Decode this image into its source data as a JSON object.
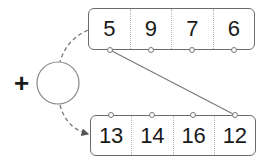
{
  "diagram": {
    "top_row": {
      "values": [
        "5",
        "9",
        "7",
        "6"
      ]
    },
    "bottom_row": {
      "values": [
        "13",
        "14",
        "16",
        "12"
      ]
    },
    "operator": "+",
    "operand_circle": "",
    "connector": {
      "from": "top_row.cell_0",
      "to": "bottom_row.cell_3"
    },
    "colors": {
      "stroke": "#6b6b6b",
      "text": "#1a1a1a",
      "background": "#ffffff"
    }
  }
}
